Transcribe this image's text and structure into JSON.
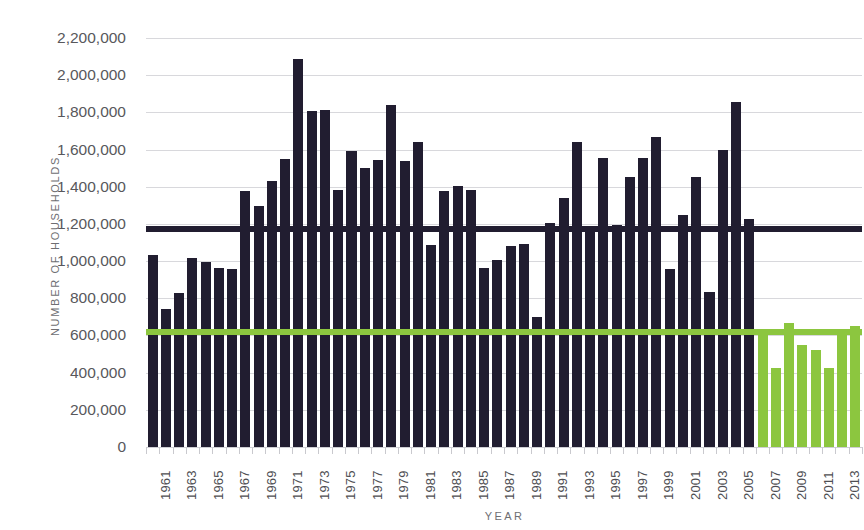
{
  "chart_data": {
    "type": "bar",
    "title": "",
    "xlabel": "YEAR",
    "ylabel": "NUMBER OF HOUSEHOLDS",
    "ylim": [
      0,
      2200000
    ],
    "ytick_step": 200000,
    "grid": true,
    "legend": "none",
    "y_tick_labels": [
      "2,200,000",
      "2,000,000",
      "1,800,000",
      "1,600,000",
      "1,400,000",
      "1,200,000",
      "1,000,000",
      "800,000",
      "600,000",
      "400,000",
      "200,000",
      "0"
    ],
    "y_tick_values": [
      2200000,
      2000000,
      1800000,
      1600000,
      1400000,
      1200000,
      1000000,
      800000,
      600000,
      400000,
      200000,
      0
    ],
    "x_tick_labels": [
      "1961",
      "1963",
      "1965",
      "1967",
      "1969",
      "1971",
      "1973",
      "1975",
      "1977",
      "1979",
      "1981",
      "1983",
      "1985",
      "1987",
      "1989",
      "1991",
      "1993",
      "1995",
      "1997",
      "1999",
      "2001",
      "2003",
      "2005",
      "2007",
      "2009",
      "2011",
      "2013"
    ],
    "categories": [
      "1961",
      "1962",
      "1963",
      "1964",
      "1965",
      "1966",
      "1967",
      "1968",
      "1969",
      "1970",
      "1971",
      "1972",
      "1973",
      "1974",
      "1975",
      "1976",
      "1977",
      "1978",
      "1979",
      "1980",
      "1981",
      "1982",
      "1983",
      "1984",
      "1985",
      "1986",
      "1987",
      "1988",
      "1989",
      "1990",
      "1991",
      "1992",
      "1993",
      "1994",
      "1995",
      "1996",
      "1997",
      "1998",
      "1999",
      "2000",
      "2001",
      "2002",
      "2003",
      "2004",
      "2005",
      "2006",
      "2007",
      "2008",
      "2009",
      "2010",
      "2011",
      "2012",
      "2013",
      "2014"
    ],
    "values": [
      1035000,
      745000,
      830000,
      1015000,
      995000,
      965000,
      960000,
      1375000,
      1295000,
      1430000,
      1550000,
      2085000,
      1810000,
      1815000,
      1385000,
      1590000,
      1500000,
      1545000,
      1840000,
      1540000,
      1640000,
      1085000,
      1375000,
      1405000,
      1380000,
      965000,
      1005000,
      1080000,
      1090000,
      700000,
      1205000,
      1340000,
      1640000,
      1190000,
      1555000,
      1195000,
      1450000,
      1555000,
      1670000,
      955000,
      1250000,
      1455000,
      835000,
      1595000,
      1855000,
      1225000,
      600000,
      425000,
      665000,
      550000,
      520000,
      425000,
      625000,
      650000
    ],
    "bar_colors": [
      "dark",
      "dark",
      "dark",
      "dark",
      "dark",
      "dark",
      "dark",
      "dark",
      "dark",
      "dark",
      "dark",
      "dark",
      "dark",
      "dark",
      "dark",
      "dark",
      "dark",
      "dark",
      "dark",
      "dark",
      "dark",
      "dark",
      "dark",
      "dark",
      "dark",
      "dark",
      "dark",
      "dark",
      "dark",
      "dark",
      "dark",
      "dark",
      "dark",
      "dark",
      "dark",
      "dark",
      "dark",
      "dark",
      "dark",
      "dark",
      "dark",
      "dark",
      "dark",
      "dark",
      "dark",
      "dark",
      "green",
      "green",
      "green",
      "green",
      "green",
      "green",
      "green",
      "green"
    ],
    "reference_lines": [
      {
        "name": "dark-average-line",
        "value": 1175000,
        "color": "#211d30"
      },
      {
        "name": "green-average-line",
        "value": 620000,
        "color": "#8cc63f"
      }
    ],
    "colors": {
      "dark_bar": "#211d30",
      "green_bar": "#8cc63f",
      "gridline": "#d8d8dc",
      "tick_text": "#58585c",
      "axis_title": "#6e6e72",
      "background": "#ffffff"
    }
  }
}
